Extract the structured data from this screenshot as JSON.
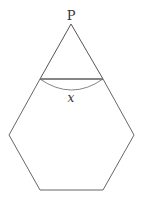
{
  "diagram": {
    "point_label": "P",
    "arc_label": "x",
    "colors": {
      "stroke": "#555555",
      "chord": "#777777",
      "text": "#333333",
      "background": "#ffffff"
    },
    "shapes": {
      "apex": [
        71,
        24
      ],
      "triangle_base_left": [
        40,
        79
      ],
      "triangle_base_right": [
        103,
        79
      ],
      "hexagon_vertices": [
        [
          40,
          79
        ],
        [
          103,
          79
        ],
        [
          134,
          135
        ],
        [
          103,
          190
        ],
        [
          40,
          190
        ],
        [
          9,
          135
        ]
      ]
    }
  }
}
